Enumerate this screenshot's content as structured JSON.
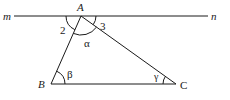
{
  "diagram": {
    "type": "geometry",
    "colors": {
      "stroke": "#1a1a1a",
      "background": "#ffffff"
    },
    "line": {
      "left_label": "m",
      "right_label": "n"
    },
    "points": {
      "A": {
        "label": "A",
        "x": 81,
        "y": 16
      },
      "B": {
        "label": "B",
        "x": 51,
        "y": 84
      },
      "C": {
        "label": "C",
        "x": 176,
        "y": 84
      }
    },
    "angle_labels": {
      "angle2": "2",
      "angle3": "3",
      "alpha": "α",
      "beta": "β",
      "gamma": "γ"
    }
  }
}
